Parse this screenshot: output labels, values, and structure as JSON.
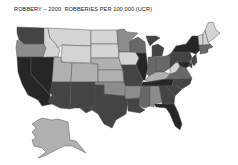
{
  "title": "ROBBERY – 2000: ROBBERIES PER 100,000 (UCR)",
  "map": {
    "type": "choropleth",
    "region": "United States",
    "insets": [
      "Alaska"
    ],
    "shade_scale": [
      "#d4d4d4",
      "#b0b0b0",
      "#8c8c8c",
      "#686868",
      "#444444",
      "#262626"
    ],
    "states": [
      {
        "id": "WA",
        "shade": 4
      },
      {
        "id": "OR",
        "shade": 2
      },
      {
        "id": "CA",
        "shade": 5
      },
      {
        "id": "NV",
        "shade": 5
      },
      {
        "id": "ID",
        "shade": 0
      },
      {
        "id": "MT",
        "shade": 0
      },
      {
        "id": "WY",
        "shade": 0
      },
      {
        "id": "UT",
        "shade": 1
      },
      {
        "id": "AZ",
        "shade": 4
      },
      {
        "id": "CO",
        "shade": 1
      },
      {
        "id": "NM",
        "shade": 4
      },
      {
        "id": "ND",
        "shade": 0
      },
      {
        "id": "SD",
        "shade": 0
      },
      {
        "id": "NE",
        "shade": 1
      },
      {
        "id": "KS",
        "shade": 1
      },
      {
        "id": "OK",
        "shade": 2
      },
      {
        "id": "TX",
        "shade": 4
      },
      {
        "id": "MN",
        "shade": 2
      },
      {
        "id": "IA",
        "shade": 0
      },
      {
        "id": "MO",
        "shade": 4
      },
      {
        "id": "AR",
        "shade": 2
      },
      {
        "id": "LA",
        "shade": 4
      },
      {
        "id": "WI",
        "shade": 3
      },
      {
        "id": "IL",
        "shade": 5
      },
      {
        "id": "MI",
        "shade": 4
      },
      {
        "id": "IN",
        "shade": 3
      },
      {
        "id": "OH",
        "shade": 3
      },
      {
        "id": "KY",
        "shade": 1
      },
      {
        "id": "TN",
        "shade": 5
      },
      {
        "id": "MS",
        "shade": 3
      },
      {
        "id": "AL",
        "shade": 2
      },
      {
        "id": "GA",
        "shade": 4
      },
      {
        "id": "FL",
        "shade": 5
      },
      {
        "id": "SC",
        "shade": 4
      },
      {
        "id": "NC",
        "shade": 4
      },
      {
        "id": "VA",
        "shade": 3
      },
      {
        "id": "WV",
        "shade": 0
      },
      {
        "id": "PA",
        "shade": 4
      },
      {
        "id": "NY",
        "shade": 5
      },
      {
        "id": "NJ",
        "shade": 4
      },
      {
        "id": "DE",
        "shade": 4
      },
      {
        "id": "MD",
        "shade": 5
      },
      {
        "id": "CT",
        "shade": 3
      },
      {
        "id": "RI",
        "shade": 3
      },
      {
        "id": "MA",
        "shade": 3
      },
      {
        "id": "VT",
        "shade": 0
      },
      {
        "id": "NH",
        "shade": 0
      },
      {
        "id": "ME",
        "shade": 0
      },
      {
        "id": "AK",
        "shade": 1
      }
    ]
  }
}
